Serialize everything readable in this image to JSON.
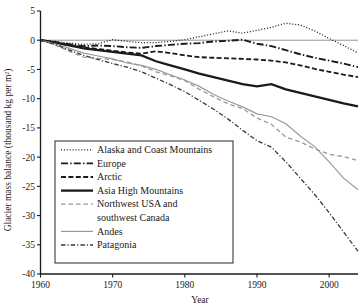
{
  "chart_data": {
    "type": "line",
    "title": "",
    "xlabel": "Year",
    "ylabel": "Glacier mass balance (thousand kg per m²)",
    "xlim": [
      1960,
      2004
    ],
    "ylim": [
      -40,
      5
    ],
    "xticks": [
      1960,
      1970,
      1980,
      1990,
      2000
    ],
    "yticks": [
      5,
      0,
      -5,
      -10,
      -15,
      -20,
      -25,
      -30,
      -35,
      -40
    ],
    "xtick_labels": [
      "1960",
      "1970",
      "1980",
      "1990",
      "2000"
    ],
    "ytick_labels": [
      "5",
      "0",
      "-5",
      "-10",
      "-15",
      "-20",
      "-25",
      "-30",
      "-35",
      "-40"
    ],
    "grid": false,
    "zero_reference_line": true,
    "legend_position": "lower-left-inside",
    "x": [
      1960,
      1962,
      1964,
      1966,
      1968,
      1970,
      1972,
      1974,
      1976,
      1978,
      1980,
      1982,
      1984,
      1986,
      1988,
      1990,
      1992,
      1994,
      1996,
      1998,
      2000,
      2002,
      2004
    ],
    "series": [
      {
        "name": "Alaska and Coast Mountains",
        "style": "dotted",
        "color": "#1a1a1a",
        "values": [
          0.0,
          -0.2,
          -0.5,
          -0.7,
          -0.6,
          0.1,
          -0.2,
          -0.4,
          -0.4,
          -0.2,
          0.1,
          0.6,
          1.1,
          1.6,
          1.2,
          1.7,
          2.2,
          2.9,
          2.6,
          1.6,
          0.3,
          -0.9,
          -2.2
        ]
      },
      {
        "name": "Europe",
        "style": "dash-dot",
        "color": "#1a1a1a",
        "values": [
          0.0,
          -0.3,
          -0.7,
          -1.0,
          -0.9,
          -1.0,
          -1.2,
          -1.3,
          -1.0,
          -0.8,
          -0.6,
          -0.5,
          -0.2,
          -0.1,
          0.1,
          -0.6,
          -1.0,
          -1.7,
          -2.4,
          -3.0,
          -3.5,
          -4.0,
          -4.6
        ]
      },
      {
        "name": "Arctic",
        "style": "dashed",
        "color": "#1a1a1a",
        "values": [
          0.0,
          -0.4,
          -0.8,
          -1.2,
          -1.5,
          -1.8,
          -2.1,
          -2.3,
          -1.9,
          -2.2,
          -2.6,
          -2.9,
          -3.0,
          -3.1,
          -3.2,
          -3.3,
          -3.5,
          -3.8,
          -4.3,
          -4.9,
          -5.4,
          -5.9,
          -6.3
        ]
      },
      {
        "name": "Asia High Mountains",
        "style": "solid-thick",
        "color": "#1a1a1a",
        "values": [
          0.0,
          -0.4,
          -0.9,
          -1.4,
          -1.7,
          -2.0,
          -2.3,
          -2.6,
          -3.6,
          -4.3,
          -5.0,
          -5.7,
          -6.3,
          -6.9,
          -7.5,
          -7.9,
          -7.5,
          -8.4,
          -9.0,
          -9.6,
          -10.2,
          -10.8,
          -11.3
        ]
      },
      {
        "name": "Northwest USA and southwest Canada",
        "style": "dashed-gray",
        "color": "#9a9a9a",
        "values": [
          0.0,
          -0.8,
          -1.9,
          -2.9,
          -3.1,
          -3.3,
          -3.7,
          -4.4,
          -5.4,
          -6.1,
          -6.9,
          -8.4,
          -9.7,
          -10.9,
          -11.7,
          -13.3,
          -14.4,
          -16.6,
          -17.4,
          -18.6,
          -19.5,
          -19.9,
          -20.6
        ]
      },
      {
        "name": "Andes",
        "style": "solid-gray",
        "color": "#9a9a9a",
        "values": [
          0.0,
          -0.6,
          -1.4,
          -2.2,
          -2.7,
          -3.2,
          -3.9,
          -4.3,
          -5.0,
          -5.9,
          -6.8,
          -7.9,
          -9.3,
          -10.4,
          -11.4,
          -12.6,
          -13.1,
          -14.3,
          -16.4,
          -18.2,
          -20.8,
          -23.6,
          -25.6
        ]
      },
      {
        "name": "Patagonia",
        "style": "dash-dot-gray",
        "color": "#3a3a3a",
        "values": [
          0.0,
          -0.7,
          -1.7,
          -2.6,
          -3.3,
          -4.0,
          -4.6,
          -5.4,
          -6.5,
          -7.6,
          -8.8,
          -10.3,
          -11.8,
          -13.5,
          -15.4,
          -17.2,
          -18.3,
          -20.8,
          -23.6,
          -26.4,
          -29.5,
          -32.8,
          -36.1
        ]
      }
    ]
  },
  "legend": {
    "entries": [
      {
        "label": "Alaska and Coast Mountains"
      },
      {
        "label": "Europe"
      },
      {
        "label": "Arctic"
      },
      {
        "label": "Asia High Mountains"
      },
      {
        "label": "Northwest USA and"
      },
      {
        "label": "southwest Canada"
      },
      {
        "label": "Andes"
      },
      {
        "label": "Patagonia"
      }
    ]
  },
  "colors": {
    "ink": "#1a1a1a",
    "gray_series": "#9a9a9a",
    "patagonia": "#3a3a3a",
    "zero_line": "#8a8a8a",
    "background": "#ffffff"
  }
}
